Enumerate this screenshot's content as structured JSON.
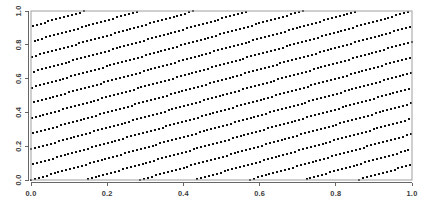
{
  "chart_data": {
    "type": "scatter",
    "title": "",
    "subtitle": "",
    "xlabel": "",
    "ylabel": "",
    "xlim": [
      0,
      1
    ],
    "ylim": [
      0,
      1
    ],
    "grid": false,
    "legend": null,
    "x_ticks": [
      0.0,
      0.2,
      0.4,
      0.6,
      0.8,
      1.0
    ],
    "y_ticks": [
      0.0,
      0.2,
      0.4,
      0.6,
      0.8,
      1.0
    ],
    "x_tick_labels": [
      "0.0",
      "0.2",
      "0.4",
      "0.6",
      "0.8",
      "1.0"
    ],
    "y_tick_labels": [
      "0.0",
      "0.2",
      "0.4",
      "0.6",
      "0.8",
      "1.0"
    ],
    "y_tick_label_rotation": -90,
    "point_marker": "square",
    "point_size_px": 2.0,
    "point_color": "#111111",
    "frame_color": "#a8a8a8",
    "axis_color": "#555555",
    "background_color": "#ffffff",
    "n_points": 1069,
    "generator": {
      "method": "rank1_lattice",
      "n": 1069,
      "a": 195,
      "x_formula": "x_i = i / n",
      "y_formula": "y_i = frac(i * a / n)",
      "i_range": [
        0,
        1068
      ]
    }
  },
  "plot_geometry": {
    "panel_left_px": 31,
    "panel_right_px": 412,
    "panel_top_px": 11,
    "panel_bottom_px": 180,
    "tick_length_px": 3.5,
    "x_label_offset_px": 6,
    "y_label_offset_px": 7
  }
}
